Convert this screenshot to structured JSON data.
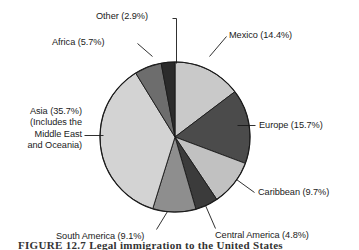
{
  "figure": {
    "background_color": "#ffffff",
    "outline_color": "#1a1a1a",
    "text_color": "#1a1a1a"
  },
  "caption": {
    "text": "FIGURE 12.7  Legal immigration to the United States"
  },
  "chart_data": {
    "type": "pie",
    "title": "",
    "subtitle": "",
    "xlabel": "",
    "ylabel": "",
    "grid": false,
    "legend_position": "none",
    "label_format": "{name} ({value}%)",
    "value_unit": "percent",
    "start_angle_deg": 0,
    "direction": "clockwise",
    "center": {
      "x": 175,
      "y": 137
    },
    "radius": 75,
    "categories": [
      "Mexico",
      "Europe",
      "Caribbean",
      "Central America",
      "South America",
      "Asia",
      "Africa",
      "Other"
    ],
    "values": [
      14.4,
      15.7,
      9.7,
      4.8,
      9.1,
      35.7,
      5.7,
      2.9
    ],
    "colors": [
      "#c9c9c9",
      "#4b4b4b",
      "#c1c1c1",
      "#3b3b3b",
      "#8e8e8e",
      "#d3d3d3",
      "#6d6d6d",
      "#2b2b2b"
    ],
    "slices": [
      {
        "name": "Mexico",
        "value": 14.4,
        "label": "Mexico (14.4%)",
        "color": "#c9c9c9"
      },
      {
        "name": "Europe",
        "value": 15.7,
        "label": "Europe (15.7%)",
        "color": "#4b4b4b"
      },
      {
        "name": "Caribbean",
        "value": 9.7,
        "label": "Caribbean (9.7%)",
        "color": "#c1c1c1"
      },
      {
        "name": "Central America",
        "value": 4.8,
        "label": "Central America (4.8%)",
        "color": "#3b3b3b"
      },
      {
        "name": "South America",
        "value": 9.1,
        "label": "South America (9.1%)",
        "color": "#8e8e8e"
      },
      {
        "name": "Asia",
        "value": 35.7,
        "label": "Asia (35.7%)",
        "label_lines": [
          "Asia (35.7%)",
          "(Includes the",
          "Middle East",
          "and Oceania)"
        ],
        "color": "#d3d3d3"
      },
      {
        "name": "Africa",
        "value": 5.7,
        "label": "Africa (5.7%)",
        "color": "#6d6d6d"
      },
      {
        "name": "Other",
        "value": 2.9,
        "label": "Other (2.9%)",
        "color": "#2b2b2b"
      }
    ]
  },
  "labels": {
    "other": "Other (2.9%)",
    "africa": "Africa (5.7%)",
    "asia_line1": "Asia (35.7%)",
    "asia_line2": "(Includes the",
    "asia_line3": "Middle East",
    "asia_line4": "and Oceania)",
    "mexico": "Mexico (14.4%)",
    "europe": "Europe (15.7%)",
    "caribbean": "Caribbean (9.7%)",
    "central_america": "Central America (4.8%)",
    "south_america": "South America (9.1%)"
  }
}
